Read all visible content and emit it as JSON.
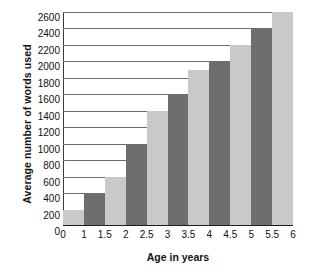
{
  "chart_data": {
    "type": "bar",
    "title": "",
    "xlabel": "Age in years",
    "ylabel": "Average number of words used",
    "categories": [
      "1",
      "1.5",
      "2",
      "2.5",
      "3",
      "3.5",
      "4",
      "4.5",
      "5",
      "5.5",
      "6"
    ],
    "values": [
      200,
      400,
      600,
      1000,
      1400,
      1600,
      1900,
      2000,
      2200,
      2400,
      2600
    ],
    "ylim": [
      0,
      2600
    ],
    "yticks": [
      0,
      200,
      400,
      600,
      800,
      1000,
      1200,
      1400,
      1600,
      1800,
      2000,
      2200,
      2400,
      2600
    ],
    "ytick_labels": [
      "0",
      "200",
      "400",
      "600",
      "800",
      "1000",
      "1200",
      "1400",
      "1600",
      "1800",
      "2000",
      "2200",
      "2400",
      "2600"
    ],
    "xtick_labels": [
      "0",
      "1",
      "1.5",
      "2",
      "2.5",
      "3",
      "3.5",
      "4",
      "4.5",
      "5",
      "5.5",
      "6"
    ],
    "grid": true,
    "legend": "none",
    "bar_colors": [
      "#c9c9c9",
      "#6e6e6e"
    ],
    "series": [
      {
        "name": "Average number of words used",
        "values": [
          200,
          400,
          600,
          1000,
          1400,
          1600,
          1900,
          2000,
          2200,
          2400,
          2600
        ]
      }
    ],
    "colors": {
      "bar_light": "#c9c9c9",
      "bar_dark": "#6e6e6e",
      "gridline": "#6b6b6b",
      "axis": "#1e1e1e",
      "text": "#111111"
    }
  }
}
